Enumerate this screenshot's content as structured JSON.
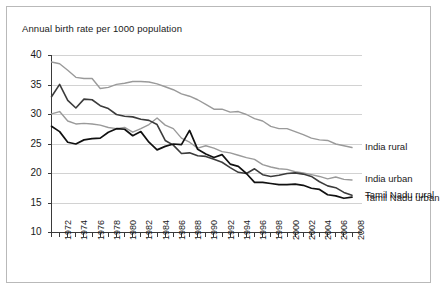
{
  "chart_data": {
    "type": "line",
    "title": "Annual birth rate per 1000 population",
    "xlabel": "",
    "ylabel": "",
    "ylim": [
      10,
      40
    ],
    "yticks": [
      10,
      15,
      20,
      25,
      30,
      35,
      40
    ],
    "ytick_labels": [
      "10",
      "15",
      "20",
      "25",
      "30",
      "35",
      "40"
    ],
    "grid": "horizontal",
    "legend_position": "right-inline",
    "x": [
      1971,
      1972,
      1973,
      1974,
      1975,
      1976,
      1977,
      1978,
      1979,
      1980,
      1981,
      1982,
      1983,
      1984,
      1985,
      1986,
      1987,
      1988,
      1989,
      1990,
      1991,
      1992,
      1993,
      1994,
      1995,
      1996,
      1997,
      1998,
      1999,
      2000,
      2001,
      2002,
      2003,
      2004,
      2005,
      2006,
      2007,
      2008
    ],
    "xtick_labels": [
      "1972",
      "1974",
      "1976",
      "1978",
      "1980",
      "1982",
      "1984",
      "1986",
      "1988",
      "1990",
      "1992",
      "1994",
      "1996",
      "1998",
      "2000",
      "2002",
      "2004",
      "2006",
      "2008"
    ],
    "xtick_years": [
      1972,
      1974,
      1976,
      1978,
      1980,
      1982,
      1984,
      1986,
      1988,
      1990,
      1992,
      1994,
      1996,
      1998,
      2000,
      2002,
      2004,
      2006,
      2008
    ],
    "series": [
      {
        "name": "India rural",
        "color": "#9a9a9a",
        "width": 1.4,
        "values": [
          38.9,
          38.6,
          37.5,
          36.3,
          36.1,
          36.1,
          34.4,
          34.6,
          35.1,
          35.3,
          35.6,
          35.6,
          35.5,
          35.2,
          34.7,
          34.2,
          33.5,
          33.1,
          32.5,
          31.7,
          30.9,
          30.9,
          30.4,
          30.5,
          30.0,
          29.3,
          28.9,
          28.0,
          27.6,
          27.6,
          27.1,
          26.6,
          26.0,
          25.7,
          25.6,
          25.0,
          24.7,
          24.4
        ]
      },
      {
        "name": "India urban",
        "color": "#9a9a9a",
        "width": 1.4,
        "values": [
          30.1,
          30.5,
          28.9,
          28.4,
          28.5,
          28.4,
          28.2,
          27.8,
          27.6,
          27.8,
          27.0,
          27.6,
          28.3,
          29.4,
          28.2,
          27.6,
          26.0,
          25.3,
          24.3,
          24.7,
          24.3,
          23.7,
          23.5,
          23.1,
          22.7,
          22.4,
          21.5,
          21.1,
          20.8,
          20.7,
          20.3,
          20.1,
          19.8,
          19.5,
          19.1,
          19.4,
          19.0,
          18.9
        ]
      },
      {
        "name": "Tamil Nadu rural",
        "color": "#3c3c3c",
        "width": 1.6,
        "values": [
          33.0,
          35.1,
          32.4,
          31.1,
          32.6,
          32.5,
          31.5,
          31.0,
          30.0,
          29.7,
          29.6,
          29.2,
          29.0,
          28.3,
          25.6,
          24.8,
          23.4,
          23.5,
          23.0,
          22.9,
          22.4,
          21.9,
          21.0,
          20.2,
          20.0,
          20.8,
          19.8,
          19.5,
          19.7,
          20.0,
          20.1,
          19.9,
          19.5,
          18.6,
          17.9,
          17.6,
          16.8,
          16.3
        ]
      },
      {
        "name": "Tamil Nadu urban",
        "color": "#111111",
        "width": 1.7,
        "values": [
          28.0,
          27.1,
          25.3,
          25.0,
          25.7,
          25.9,
          26.0,
          27.0,
          27.6,
          27.5,
          26.4,
          27.1,
          25.3,
          24.0,
          24.6,
          25.0,
          24.9,
          27.3,
          24.1,
          23.3,
          22.7,
          23.2,
          21.6,
          21.2,
          20.0,
          18.5,
          18.5,
          18.3,
          18.1,
          18.1,
          18.2,
          18.0,
          17.5,
          17.3,
          16.4,
          16.2,
          15.8,
          16.0
        ]
      }
    ],
    "series_labels": [
      {
        "text": "India rural",
        "value": 24.4
      },
      {
        "text": "India urban",
        "value": 18.9
      },
      {
        "text": "Tamil Nadu rural",
        "value": 16.3
      },
      {
        "text": "Tamil Nadu urban",
        "value": 15.8
      }
    ]
  },
  "colors": {
    "frame_border": "#b9b9b9",
    "gridline": "#d2d2d2",
    "axis": "#3a3a3a",
    "text": "#1a1a1a",
    "background": "#ffffff"
  }
}
